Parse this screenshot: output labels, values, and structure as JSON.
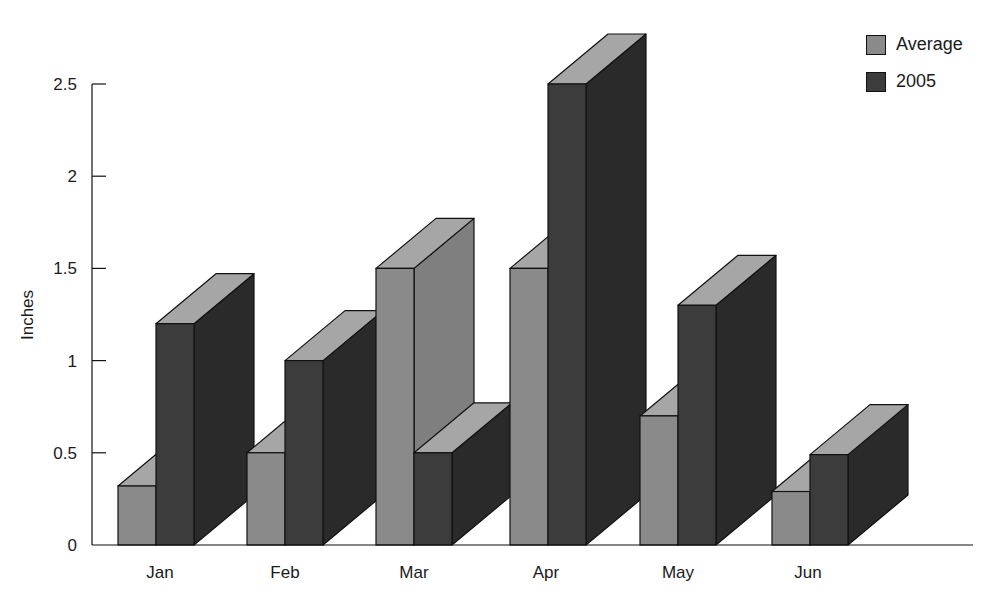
{
  "chart_data": {
    "type": "bar",
    "style": "3d-clustered",
    "title": "",
    "xlabel": "",
    "ylabel": "Inches",
    "ylim": [
      0,
      2.5
    ],
    "yticks": [
      0,
      0.5,
      1,
      1.5,
      2,
      2.5
    ],
    "ytick_labels": [
      "0",
      "0.5",
      "1",
      "1.5",
      "2",
      "2.5"
    ],
    "grid": false,
    "legend_position": "top-right",
    "categories": [
      "Jan",
      "Feb",
      "Mar",
      "Apr",
      "May",
      "Jun"
    ],
    "series": [
      {
        "name": "Average",
        "color": "#8a8a8a",
        "values": [
          0.32,
          0.5,
          1.5,
          1.5,
          0.7,
          0.29
        ]
      },
      {
        "name": "2005",
        "color": "#3c3c3c",
        "values": [
          1.2,
          1.0,
          0.5,
          2.5,
          1.3,
          0.49
        ]
      }
    ]
  },
  "legend": {
    "items": [
      {
        "label": "Average",
        "color": "#8a8a8a"
      },
      {
        "label": "2005",
        "color": "#3c3c3c"
      }
    ]
  }
}
